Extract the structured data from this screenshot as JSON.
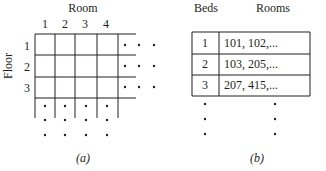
{
  "panel_a": {
    "x_axis_title": "Room",
    "y_axis_title": "Floor",
    "room_labels": [
      "1",
      "2",
      "3",
      "4"
    ],
    "floor_labels": [
      "1",
      "2",
      "3"
    ],
    "caption": "(a)"
  },
  "panel_b": {
    "headers": {
      "beds": "Beds",
      "rooms": "Rooms"
    },
    "rows": [
      {
        "beds": "1",
        "rooms": "101, 102,..."
      },
      {
        "beds": "2",
        "rooms": "103, 205,..."
      },
      {
        "beds": "3",
        "rooms": "207, 415,..."
      }
    ],
    "caption": "(b)"
  },
  "colors": {
    "ink": "#231f20",
    "background": "#ffffff"
  }
}
